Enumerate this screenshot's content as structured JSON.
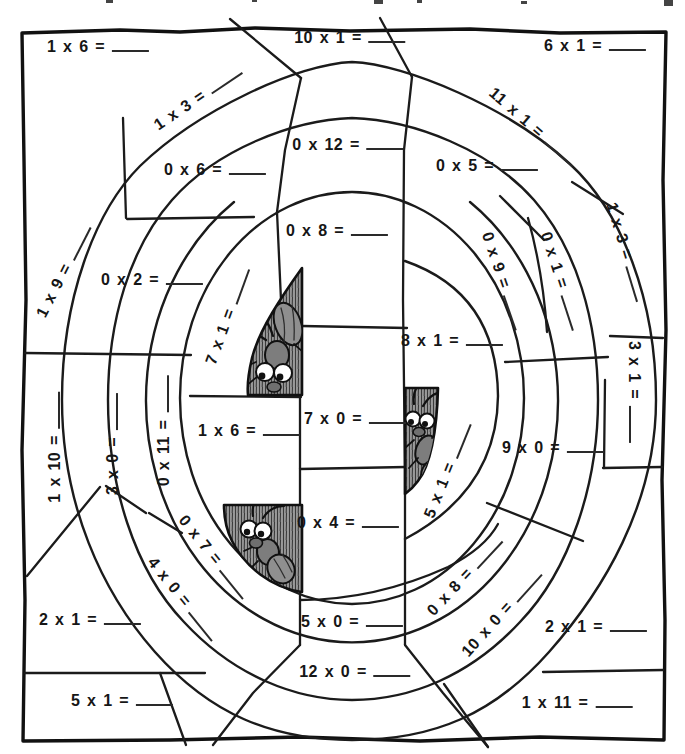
{
  "worksheet": {
    "problems": [
      {
        "label": "1 x 6 ="
      },
      {
        "label": "10 x 1 ="
      },
      {
        "label": "6 x 1 ="
      },
      {
        "label": "1 x 3 ="
      },
      {
        "label": "11 x 1 ="
      },
      {
        "label": "0 x 6 ="
      },
      {
        "label": "0 x 12 ="
      },
      {
        "label": "0 x 5 ="
      },
      {
        "label": "0 x 8 ="
      },
      {
        "label": "0 x 2 ="
      },
      {
        "label": "1 x 9 ="
      },
      {
        "label": "0 x 9 ="
      },
      {
        "label": "0 x 1 ="
      },
      {
        "label": "1 x 3 ="
      },
      {
        "label": "3 x 1 ="
      },
      {
        "label": "7 x 1 ="
      },
      {
        "label": "8 x 1 ="
      },
      {
        "label": "1 x 6 ="
      },
      {
        "label": "7 x 0 ="
      },
      {
        "label": "9 x 0 ="
      },
      {
        "label": "1 x 10 ="
      },
      {
        "label": "3 x 0 ="
      },
      {
        "label": "0 x 11 ="
      },
      {
        "label": "0 x 4 ="
      },
      {
        "label": "5 x 1 ="
      },
      {
        "label": "0 x 7 ="
      },
      {
        "label": "4 x 0 ="
      },
      {
        "label": "0 x 8 ="
      },
      {
        "label": "10 x 0 ="
      },
      {
        "label": "2 x 1 ="
      },
      {
        "label": "5 x 0 ="
      },
      {
        "label": "12 x 0 ="
      },
      {
        "label": "2 x 1 ="
      },
      {
        "label": "5 x 1 ="
      },
      {
        "label": "1 x 11 ="
      }
    ],
    "illustrations": [
      {
        "icon": "ant-icon",
        "position": "center-left"
      },
      {
        "icon": "ant-icon",
        "position": "center-right"
      },
      {
        "icon": "ant-icon",
        "position": "bottom-center-left"
      }
    ],
    "colors": {
      "ink": "#161616",
      "paper": "#ffffff",
      "wedge_shade": "#9a9a9a",
      "ant_body": "#7d7d7d"
    }
  }
}
